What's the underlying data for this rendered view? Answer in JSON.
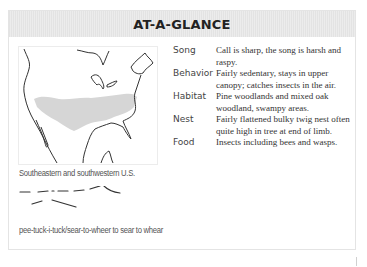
{
  "header": {
    "title": "AT-A-GLANCE"
  },
  "map": {
    "range_caption": "Southeastern and southwestern U.S.",
    "range_color": "#d6d6d6"
  },
  "song": {
    "phonetic": "pee-tuck-i-tuck/sear-to-wheer to sear to whear"
  },
  "facts": [
    {
      "label": "Song",
      "value": "Call is sharp, the song is harsh and raspy."
    },
    {
      "label": "Behavior",
      "value": "Fairly sedentary, stays in upper canopy; catches insects in the air."
    },
    {
      "label": "Habitat",
      "value": "Pine woodlands and mixed oak woodland, swampy areas."
    },
    {
      "label": "Nest",
      "value": "Fairly flattened bulky twig nest often quite high in tree at end of limb."
    },
    {
      "label": "Food",
      "value": "Insects including bees and wasps."
    }
  ]
}
